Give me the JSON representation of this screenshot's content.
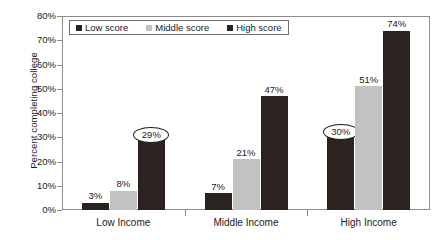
{
  "chart_data": {
    "type": "bar",
    "title": "",
    "xlabel": "",
    "ylabel": "Percent completing college",
    "categories": [
      "Low Income",
      "Middle Income",
      "High Income"
    ],
    "series": [
      {
        "name": "Low score",
        "values": [
          3,
          7,
          30
        ],
        "color": "#2b2320"
      },
      {
        "name": "Middle score",
        "values": [
          8,
          21,
          51
        ],
        "color": "#c2c2c2"
      },
      {
        "name": "High score",
        "values": [
          47,
          47,
          74
        ],
        "color": "#2b2320"
      }
    ],
    "value_labels": [
      [
        "3%",
        "8%",
        "29%"
      ],
      [
        "7%",
        "21%",
        "47%"
      ],
      [
        "30%",
        "51%",
        "74%"
      ]
    ],
    "ylim": [
      0,
      80
    ],
    "ytick_values": [
      80,
      70,
      60,
      50,
      40,
      30,
      20,
      10,
      0
    ],
    "yticks": [
      "80%",
      "70%",
      "60%",
      "50%",
      "40%",
      "30%",
      "20%",
      "10%",
      "0%"
    ],
    "grid": false,
    "legend_position": "top-left-inside",
    "annotations": [
      {
        "label": "29%",
        "group": "Low Income",
        "series": "High score",
        "shape": "ellipse"
      },
      {
        "label": "30%",
        "group": "High Income",
        "series": "Low score",
        "shape": "ellipse"
      }
    ]
  },
  "bars": [
    {
      "group": 0,
      "series": 0,
      "value": 3,
      "label": "3%",
      "tone": "low",
      "circled": false
    },
    {
      "group": 0,
      "series": 1,
      "value": 8,
      "label": "8%",
      "tone": "middle",
      "circled": false
    },
    {
      "group": 0,
      "series": 2,
      "value": 29,
      "label": "29%",
      "tone": "high",
      "circled": true
    },
    {
      "group": 1,
      "series": 0,
      "value": 7,
      "label": "7%",
      "tone": "low",
      "circled": false
    },
    {
      "group": 1,
      "series": 1,
      "value": 21,
      "label": "21%",
      "tone": "middle",
      "circled": false
    },
    {
      "group": 1,
      "series": 2,
      "value": 47,
      "label": "47%",
      "tone": "high",
      "circled": false
    },
    {
      "group": 2,
      "series": 0,
      "value": 30,
      "label": "30%",
      "tone": "low",
      "circled": true
    },
    {
      "group": 2,
      "series": 1,
      "value": 51,
      "label": "51%",
      "tone": "middle",
      "circled": false
    },
    {
      "group": 2,
      "series": 2,
      "value": 74,
      "label": "74%",
      "tone": "high",
      "circled": false
    }
  ],
  "legend": {
    "items": [
      {
        "label": "Low score",
        "color": "#2b2320"
      },
      {
        "label": "Middle score",
        "color": "#c2c2c2"
      },
      {
        "label": "High score",
        "color": "#2b2320"
      }
    ]
  }
}
